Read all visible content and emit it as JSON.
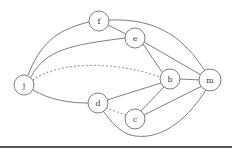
{
  "graph": {
    "nodes": [
      {
        "id": "f",
        "label": "f",
        "x": 99,
        "y": 21
      },
      {
        "id": "e",
        "label": "e",
        "x": 135,
        "y": 38
      },
      {
        "id": "j",
        "label": "j",
        "x": 24,
        "y": 85
      },
      {
        "id": "b",
        "label": "b",
        "x": 170,
        "y": 79
      },
      {
        "id": "m",
        "label": "m",
        "x": 210,
        "y": 80
      },
      {
        "id": "d",
        "label": "d",
        "x": 98,
        "y": 103
      },
      {
        "id": "c",
        "label": "c",
        "x": 135,
        "y": 119
      }
    ],
    "edges": [
      {
        "from": "j",
        "to": "f",
        "style": "solid"
      },
      {
        "from": "j",
        "to": "e",
        "style": "solid"
      },
      {
        "from": "j",
        "to": "b",
        "style": "dotted"
      },
      {
        "from": "j",
        "to": "d",
        "style": "solid"
      },
      {
        "from": "f",
        "to": "e",
        "style": "solid"
      },
      {
        "from": "f",
        "to": "m",
        "style": "solid"
      },
      {
        "from": "e",
        "to": "b",
        "style": "solid"
      },
      {
        "from": "e",
        "to": "m",
        "style": "solid"
      },
      {
        "from": "b",
        "to": "m",
        "style": "solid"
      },
      {
        "from": "b",
        "to": "d",
        "style": "solid"
      },
      {
        "from": "b",
        "to": "c",
        "style": "solid"
      },
      {
        "from": "m",
        "to": "c",
        "style": "solid"
      },
      {
        "from": "m",
        "to": "d",
        "style": "solid"
      },
      {
        "from": "d",
        "to": "c",
        "style": "dotted"
      }
    ]
  },
  "colors": {
    "stroke": "#6e6e6e",
    "dotted": "#9a9a9a",
    "rule": "#555555"
  }
}
